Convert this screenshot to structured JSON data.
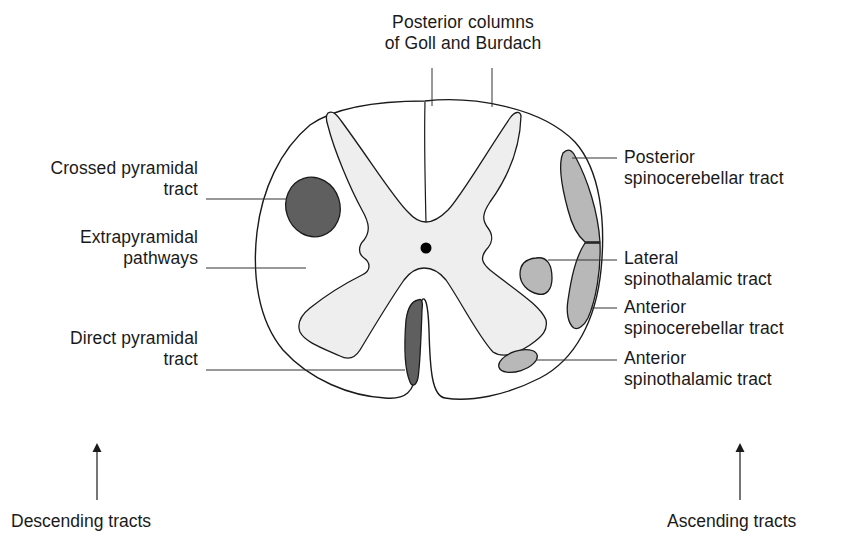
{
  "diagram": {
    "colors": {
      "outline": "#1a1a1a",
      "gray_matter": "#eeeeee",
      "white_matter": "#ffffff",
      "descending_tract_fill": "#5f5f5f",
      "ascending_tract_fill": "#b8b8b8",
      "central_canal": "#000000"
    },
    "labels": {
      "posterior_columns": {
        "line1": "Posterior columns",
        "line2": "of Goll and Burdach"
      },
      "crossed_pyramidal": {
        "line1": "Crossed pyramidal",
        "line2": "tract"
      },
      "extrapyramidal": {
        "line1": "Extrapyramidal",
        "line2": "pathways"
      },
      "direct_pyramidal": {
        "line1": "Direct pyramidal",
        "line2": "tract"
      },
      "posterior_spinocerebellar": {
        "line1": "Posterior",
        "line2": "spinocerebellar tract"
      },
      "lateral_spinothalamic": {
        "line1": "Lateral",
        "line2": "spinothalamic tract"
      },
      "anterior_spinocerebellar": {
        "line1": "Anterior",
        "line2": "spinocerebellar tract"
      },
      "anterior_spinothalamic": {
        "line1": "Anterior",
        "line2": "spinothalamic tract"
      }
    },
    "groups": {
      "descending": {
        "label": "Descending tracts",
        "arrow": "up-arrow"
      },
      "ascending": {
        "label": "Ascending tracts",
        "arrow": "up-arrow"
      }
    }
  }
}
